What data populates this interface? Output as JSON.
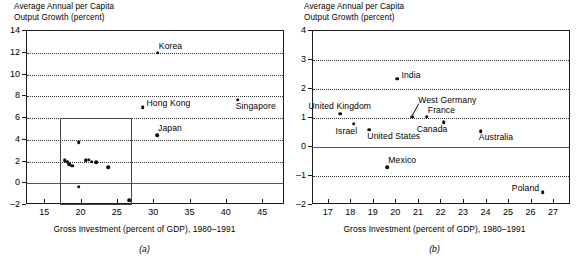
{
  "figure": {
    "panel_a_letter": "(a)",
    "panel_b_letter": "(b)"
  },
  "panel_a": {
    "ylabel": "Average Annual per Capita\nOutput Growth (percent)",
    "xlabel": "Gross Investment (percent of GDP), 1980–1991",
    "yticks": [
      "14",
      "12",
      "10",
      "8",
      "6",
      "4",
      "2",
      "0",
      "–2"
    ],
    "xticks": [
      "15",
      "20",
      "25",
      "30",
      "35",
      "40",
      "45"
    ]
  },
  "panel_b": {
    "ylabel": "Average Annual per Capita\nOutput Growth (percent)",
    "xlabel": "Gross Investment (percent of GDP), 1980–1991",
    "yticks": [
      "4",
      "3",
      "2",
      "1",
      "0",
      "–1",
      "–2"
    ],
    "xticks": [
      "17",
      "18",
      "19",
      "20",
      "21",
      "22",
      "23",
      "24",
      "25",
      "26",
      "27"
    ]
  },
  "chart_data": [
    {
      "type": "scatter",
      "panel": "(a)",
      "title": "",
      "xlabel": "Gross Investment (percent of GDP), 1980–1991",
      "ylabel": "Average Annual per Capita Output Growth (percent)",
      "xlim": [
        12.5,
        48.0
      ],
      "ylim": [
        -2,
        14
      ],
      "xticks": [
        15,
        20,
        25,
        30,
        35,
        40,
        45
      ],
      "yticks": [
        -2,
        0,
        2,
        4,
        6,
        8,
        10,
        12,
        14
      ],
      "grid": "horizontal-dotted",
      "legend": "none",
      "zero_line": 0,
      "inset_rect": {
        "x0": 17.0,
        "x1": 27.0,
        "y0": -2,
        "y1": 6
      },
      "points": [
        {
          "label": "Korea",
          "x": 30.5,
          "y": 12.0,
          "label_pos": "above-right"
        },
        {
          "label": "Singapore",
          "x": 41.5,
          "y": 7.7,
          "label_pos": "below-right"
        },
        {
          "label": "Hong Kong",
          "x": 28.4,
          "y": 7.0,
          "label_pos": "right"
        },
        {
          "label": "Japan",
          "x": 30.4,
          "y": 4.4,
          "label_pos": "above-right"
        },
        {
          "label": "",
          "x": 17.7,
          "y": 2.1,
          "label_pos": ""
        },
        {
          "label": "",
          "x": 18.0,
          "y": 2.0,
          "label_pos": ""
        },
        {
          "label": "",
          "x": 18.3,
          "y": 1.75,
          "label_pos": ""
        },
        {
          "label": "",
          "x": 18.7,
          "y": 1.6,
          "label_pos": ""
        },
        {
          "label": "",
          "x": 19.6,
          "y": 3.8,
          "label_pos": ""
        },
        {
          "label": "",
          "x": 20.6,
          "y": 2.1,
          "label_pos": ""
        },
        {
          "label": "",
          "x": 21.0,
          "y": 2.15,
          "label_pos": ""
        },
        {
          "label": "",
          "x": 21.4,
          "y": 2.0,
          "label_pos": ""
        },
        {
          "label": "",
          "x": 22.0,
          "y": 1.95,
          "label_pos": ""
        },
        {
          "label": "",
          "x": 23.7,
          "y": 1.45,
          "label_pos": ""
        },
        {
          "label": "",
          "x": 19.6,
          "y": -0.3,
          "label_pos": ""
        },
        {
          "label": "",
          "x": 26.6,
          "y": -1.55,
          "label_pos": ""
        }
      ]
    },
    {
      "type": "scatter",
      "panel": "(b)",
      "title": "",
      "xlabel": "Gross Investment (percent of GDP), 1980–1991",
      "ylabel": "Average Annual per Capita Output Growth (percent)",
      "xlim": [
        16.3,
        27.75
      ],
      "ylim": [
        -2,
        4
      ],
      "xticks": [
        17,
        18,
        19,
        20,
        21,
        22,
        23,
        24,
        25,
        26,
        27
      ],
      "yticks": [
        -2,
        -1,
        0,
        1,
        2,
        3,
        4
      ],
      "grid": "horizontal-dotted",
      "legend": "none",
      "zero_line": 0,
      "points": [
        {
          "label": "India",
          "x": 20.05,
          "y": 2.35,
          "label_pos": "right"
        },
        {
          "label": "United Kingdom",
          "x": 17.5,
          "y": 1.15,
          "label_pos": "above-left"
        },
        {
          "label": "West Germany",
          "x": 20.7,
          "y": 1.05,
          "label_pos": "leader-up-right"
        },
        {
          "label": "France",
          "x": 21.35,
          "y": 1.05,
          "label_pos": "above-right"
        },
        {
          "label": "Israel",
          "x": 18.1,
          "y": 0.8,
          "label_pos": "below-left"
        },
        {
          "label": "Canada",
          "x": 22.1,
          "y": 0.85,
          "label_pos": "below-left"
        },
        {
          "label": "United States",
          "x": 18.8,
          "y": 0.6,
          "label_pos": "below-right"
        },
        {
          "label": "Australia",
          "x": 23.75,
          "y": 0.55,
          "label_pos": "below-right"
        },
        {
          "label": "Mexico",
          "x": 19.6,
          "y": -0.7,
          "label_pos": "above-right"
        },
        {
          "label": "Poland",
          "x": 26.5,
          "y": -1.55,
          "label_pos": "left"
        }
      ]
    }
  ]
}
